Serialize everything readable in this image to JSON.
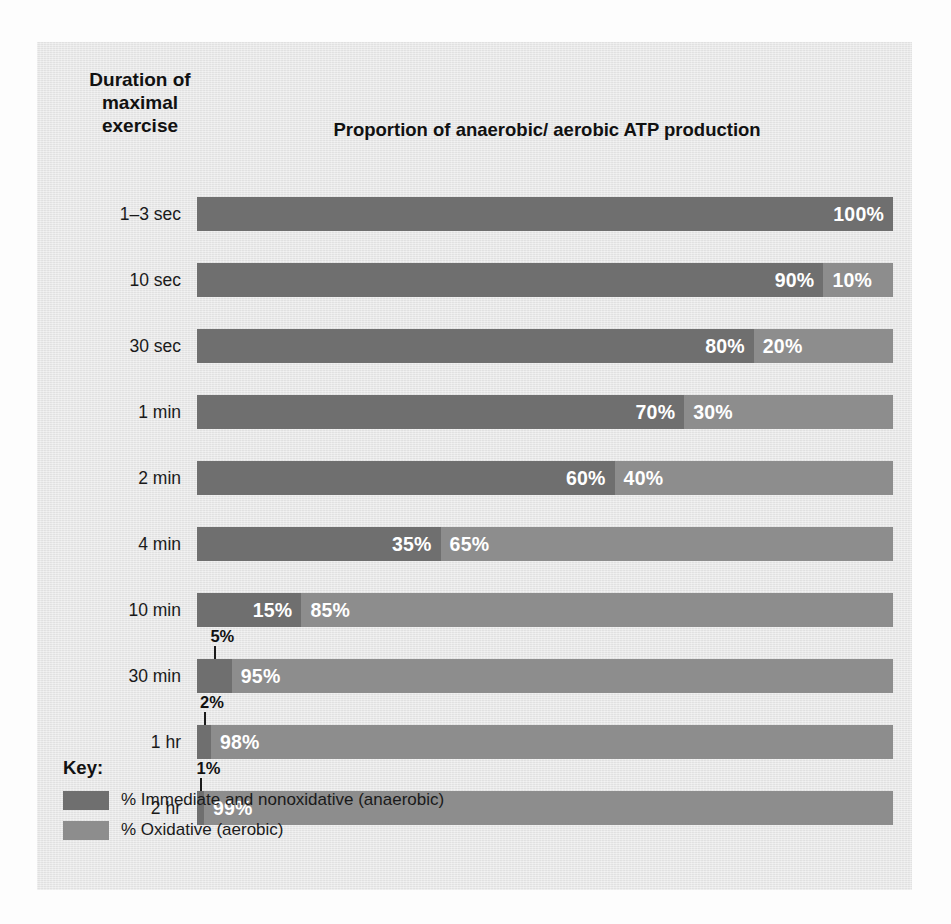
{
  "figure": {
    "duration_heading_lines": [
      "Duration of",
      "maximal",
      "exercise"
    ],
    "title": "Proportion of anaerobic/ aerobic ATP production",
    "key_title": "Key:"
  },
  "legend": {
    "items": [
      {
        "label": "% Immediate and nonoxidative (anaerobic)",
        "color": "#6f6f6f"
      },
      {
        "label": "% Oxidative (aerobic)",
        "color": "#8d8d8d"
      }
    ]
  },
  "chart_data": {
    "type": "bar",
    "orientation": "horizontal",
    "stacked": true,
    "normalized_to_percent": true,
    "title": "Proportion of anaerobic/ aerobic ATP production",
    "xlabel": "",
    "ylabel": "Duration of maximal exercise",
    "xlim": [
      0,
      100
    ],
    "grid": false,
    "legend_position": "bottom-left",
    "categories": [
      "1–3 sec",
      "10 sec",
      "30 sec",
      "1 min",
      "2 min",
      "4 min",
      "10 min",
      "30 min",
      "1 hr",
      "2 hr"
    ],
    "series": [
      {
        "name": "% Immediate and nonoxidative (anaerobic)",
        "color": "#6f6f6f",
        "values": [
          100,
          90,
          80,
          70,
          60,
          35,
          15,
          5,
          2,
          1
        ]
      },
      {
        "name": "% Oxidative (aerobic)",
        "color": "#8d8d8d",
        "values": [
          0,
          10,
          20,
          30,
          40,
          65,
          85,
          95,
          98,
          99
        ]
      }
    ],
    "rows": [
      {
        "category": "1–3 sec",
        "anaerobic": 100,
        "aerobic": 0,
        "anaerobic_label": "100%",
        "aerobic_label": "",
        "anaerobic_label_external": false
      },
      {
        "category": "10 sec",
        "anaerobic": 90,
        "aerobic": 10,
        "anaerobic_label": "90%",
        "aerobic_label": "10%",
        "anaerobic_label_external": false
      },
      {
        "category": "30 sec",
        "anaerobic": 80,
        "aerobic": 20,
        "anaerobic_label": "80%",
        "aerobic_label": "20%",
        "anaerobic_label_external": false
      },
      {
        "category": "1 min",
        "anaerobic": 70,
        "aerobic": 30,
        "anaerobic_label": "70%",
        "aerobic_label": "30%",
        "anaerobic_label_external": false
      },
      {
        "category": "2 min",
        "anaerobic": 60,
        "aerobic": 40,
        "anaerobic_label": "60%",
        "aerobic_label": "40%",
        "anaerobic_label_external": false
      },
      {
        "category": "4 min",
        "anaerobic": 35,
        "aerobic": 65,
        "anaerobic_label": "35%",
        "aerobic_label": "65%",
        "anaerobic_label_external": false
      },
      {
        "category": "10 min",
        "anaerobic": 15,
        "aerobic": 85,
        "anaerobic_label": "15%",
        "aerobic_label": "85%",
        "anaerobic_label_external": false
      },
      {
        "category": "30 min",
        "anaerobic": 5,
        "aerobic": 95,
        "anaerobic_label": "5%",
        "aerobic_label": "95%",
        "anaerobic_label_external": true
      },
      {
        "category": "1 hr",
        "anaerobic": 2,
        "aerobic": 98,
        "anaerobic_label": "2%",
        "aerobic_label": "98%",
        "anaerobic_label_external": true
      },
      {
        "category": "2 hr",
        "anaerobic": 1,
        "aerobic": 99,
        "anaerobic_label": "1%",
        "aerobic_label": "99%",
        "anaerobic_label_external": true
      }
    ]
  },
  "layout": {
    "bar_left_px": 160,
    "bar_width_px": 696,
    "bar_height_px": 34,
    "first_row_top_px": 155,
    "row_pitch_px": 66
  }
}
